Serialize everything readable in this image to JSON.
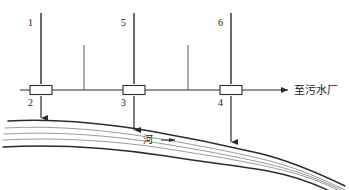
{
  "diagram": {
    "background_color": "#ffffff",
    "line_color": "#2b2b2b",
    "thin_line_color": "#5a5a5a",
    "labels": {
      "outfall_1": "1",
      "outfall_5": "5",
      "outfall_6": "6",
      "node_2": "2",
      "node_3": "3",
      "node_4": "4",
      "destination": "至污水厂",
      "river": "河"
    },
    "nodes": [
      {
        "id": "2",
        "label": "2",
        "x": 41,
        "y": 90
      },
      {
        "id": "3",
        "label": "3",
        "x": 134,
        "y": 90
      },
      {
        "id": "4",
        "label": "4",
        "x": 231,
        "y": 90
      }
    ],
    "outfalls": [
      {
        "id": "1",
        "label": "1",
        "x": 41,
        "top": 13,
        "arrow_y": 119
      },
      {
        "id": "5",
        "label": "5",
        "x": 134,
        "top": 13,
        "arrow_y": 131
      },
      {
        "id": "6",
        "label": "6",
        "x": 231,
        "top": 13,
        "arrow_y": 143
      }
    ],
    "branches": [
      {
        "x": 84,
        "top": 45,
        "bottom": 90
      },
      {
        "x": 188,
        "top": 45,
        "bottom": 90
      }
    ],
    "main_pipe": {
      "y": 90,
      "x_start": 20,
      "x_end": 290,
      "arrow": true
    },
    "river": {
      "label": "河",
      "label_x": 148,
      "label_y": 143,
      "flow_arrow_x": 168,
      "flow_arrow_y": 140,
      "curve_count": 5
    }
  }
}
